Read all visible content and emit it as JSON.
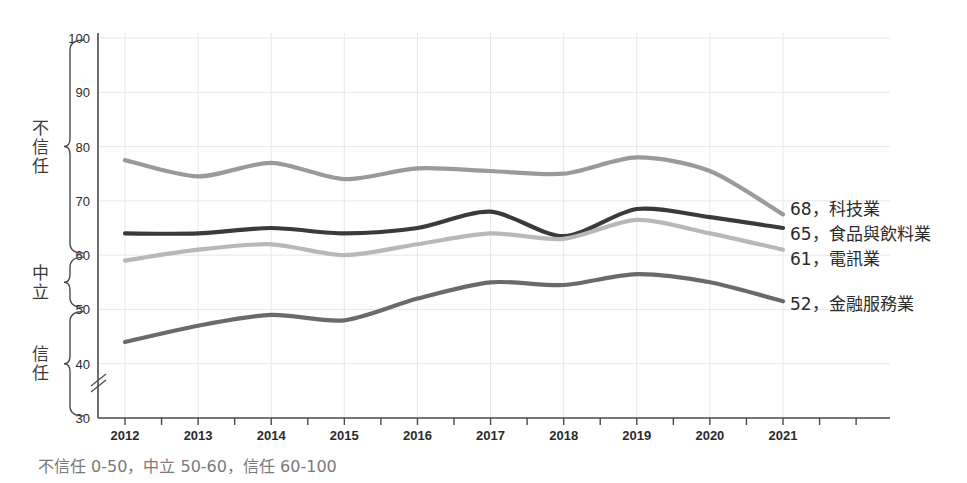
{
  "chart_data": {
    "type": "line",
    "title": "",
    "xlabel": "",
    "ylabel": "",
    "x": [
      2012,
      2013,
      2014,
      2015,
      2016,
      2017,
      2018,
      2019,
      2020,
      2021
    ],
    "categories": [
      "2012",
      "2013",
      "2014",
      "2015",
      "2016",
      "2017",
      "2018",
      "2019",
      "2020",
      "2021"
    ],
    "xlim": [
      2012,
      2021
    ],
    "ylim": [
      30,
      100
    ],
    "yticks": [
      30,
      40,
      50,
      60,
      70,
      80,
      90,
      100
    ],
    "grid": true,
    "legend_position": "right-end-of-line",
    "axis_break": "below 40",
    "series": [
      {
        "name": "食品與飲料業",
        "color": "#9a9a9a",
        "end_value": 65,
        "end_label": "65，食品與飲料業",
        "values": [
          77.5,
          74.5,
          77,
          74,
          76,
          75.5,
          75,
          78,
          75.5,
          67.5
        ]
      },
      {
        "name": "科技業",
        "color": "#3a3a3a",
        "end_value": 68,
        "end_label": "68，科技業",
        "values": [
          64,
          64,
          65,
          64,
          65,
          68,
          63.5,
          68.5,
          67,
          65
        ]
      },
      {
        "name": "電訊業",
        "color": "#b8b8b8",
        "end_value": 61,
        "end_label": "61，電訊業",
        "values": [
          59,
          61,
          62,
          60,
          62,
          64,
          63,
          66.5,
          64,
          61
        ]
      },
      {
        "name": "金融服務業",
        "color": "#6a6a6a",
        "end_value": 52,
        "end_label": "52，金融服務業",
        "values": [
          44,
          47,
          49,
          48,
          52,
          55,
          54.5,
          56.5,
          55,
          51.5
        ]
      }
    ]
  },
  "yaxis": {
    "ticks": [
      "100",
      "90",
      "80",
      "70",
      "60",
      "50",
      "40",
      "30"
    ],
    "break_symbol": "axis-break"
  },
  "xaxis": {
    "ticks": [
      "2012",
      "2013",
      "2014",
      "2015",
      "2016",
      "2017",
      "2018",
      "2019",
      "2020",
      "2021"
    ]
  },
  "brackets": [
    {
      "label": "不信任",
      "from": 60,
      "to": 100
    },
    {
      "label": "中立",
      "from": 50,
      "to": 60
    },
    {
      "label": "信任",
      "from": 30,
      "to": 50
    }
  ],
  "legend": {
    "items": [
      {
        "value": "68",
        "separator": "，",
        "name": "科技業",
        "text": "68，科技業"
      },
      {
        "value": "65",
        "separator": "，",
        "name": "食品與飲料業",
        "text": "65，食品與飲料業"
      },
      {
        "value": "61",
        "separator": "，",
        "name": "電訊業",
        "text": "61，電訊業"
      },
      {
        "value": "52",
        "separator": "，",
        "name": "金融服務業",
        "text": "52，金融服務業"
      }
    ]
  },
  "footnote": {
    "text": "不信任 0-50，中立 50-60，信任 60-100"
  },
  "colors": {
    "tech": "#3a3a3a",
    "food_beverage": "#9a9a9a",
    "telecom": "#b8b8b8",
    "financial": "#6a6a6a",
    "axis": "#4a4a4a",
    "grid": "#e7e7ea",
    "text": "#2b2b2b",
    "footnote": "#7a7a7a"
  }
}
